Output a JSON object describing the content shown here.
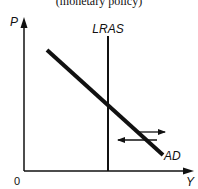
{
  "caption": "(monetary policy)",
  "axes": {
    "y_label": "P",
    "x_label": "Y",
    "origin_label": "0"
  },
  "curves": {
    "lras_label": "LRAS",
    "ad_label": "AD"
  },
  "shift_arrows": [
    {
      "direction": "right"
    },
    {
      "direction": "left"
    }
  ],
  "colors": {
    "ink": "#111111",
    "background": "#ffffff"
  }
}
